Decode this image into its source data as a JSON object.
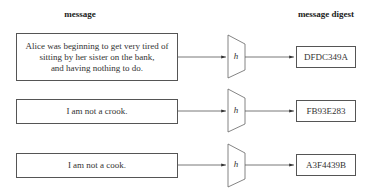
{
  "headers": {
    "message": "message",
    "digest": "message digest"
  },
  "function_label": "h",
  "rows": [
    {
      "message_lines": [
        "Alice was beginning to get very tired of",
        "sitting by her sister on the bank,",
        "and having nothing to do."
      ],
      "digest": "DFDC349A"
    },
    {
      "message_lines": [
        "I am not a crook."
      ],
      "digest": "FB93E283"
    },
    {
      "message_lines": [
        "I am not a cook."
      ],
      "digest": "A3F4439B"
    }
  ]
}
